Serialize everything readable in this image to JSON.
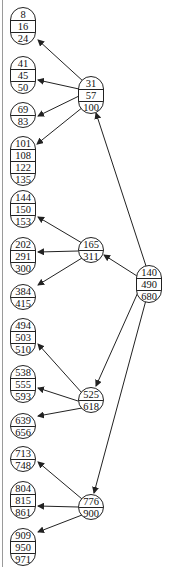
{
  "diagram": {
    "type": "b-tree",
    "root": {
      "id": "root",
      "keys": [
        "140",
        "490",
        "680"
      ],
      "x": 136,
      "y": 265,
      "w": 26
    },
    "internal": [
      {
        "id": "n1",
        "keys": [
          "31",
          "57",
          "100"
        ],
        "x": 78,
        "y": 76,
        "w": 26
      },
      {
        "id": "n2",
        "keys": [
          "165",
          "311"
        ],
        "x": 78,
        "y": 237,
        "w": 26
      },
      {
        "id": "n3",
        "keys": [
          "525",
          "618"
        ],
        "x": 78,
        "y": 387,
        "w": 26
      },
      {
        "id": "n4",
        "keys": [
          "776",
          "900"
        ],
        "x": 78,
        "y": 494,
        "w": 26
      }
    ],
    "leaves": [
      {
        "id": "l1",
        "keys": [
          "8",
          "16",
          "24"
        ],
        "x": 10,
        "y": 7,
        "w": 26
      },
      {
        "id": "l2",
        "keys": [
          "41",
          "45",
          "50"
        ],
        "x": 10,
        "y": 56,
        "w": 26
      },
      {
        "id": "l3",
        "keys": [
          "69",
          "83"
        ],
        "x": 10,
        "y": 102,
        "w": 26
      },
      {
        "id": "l4",
        "keys": [
          "101",
          "108",
          "122",
          "135"
        ],
        "x": 10,
        "y": 136,
        "w": 26
      },
      {
        "id": "l5",
        "keys": [
          "144",
          "150",
          "153"
        ],
        "x": 10,
        "y": 190,
        "w": 26
      },
      {
        "id": "l6",
        "keys": [
          "202",
          "291",
          "300"
        ],
        "x": 10,
        "y": 237,
        "w": 26
      },
      {
        "id": "l7",
        "keys": [
          "384",
          "415"
        ],
        "x": 10,
        "y": 284,
        "w": 26
      },
      {
        "id": "l8",
        "keys": [
          "494",
          "503",
          "510"
        ],
        "x": 10,
        "y": 318,
        "w": 26
      },
      {
        "id": "l9",
        "keys": [
          "538",
          "555",
          "593"
        ],
        "x": 10,
        "y": 365,
        "w": 26
      },
      {
        "id": "l10",
        "keys": [
          "639",
          "656"
        ],
        "x": 10,
        "y": 413,
        "w": 26
      },
      {
        "id": "l11",
        "keys": [
          "713",
          "748"
        ],
        "x": 10,
        "y": 446,
        "w": 26
      },
      {
        "id": "l12",
        "keys": [
          "804",
          "815",
          "861"
        ],
        "x": 10,
        "y": 481,
        "w": 26
      },
      {
        "id": "l13",
        "keys": [
          "909",
          "950",
          "971"
        ],
        "x": 10,
        "y": 528,
        "w": 26
      }
    ],
    "edges": [
      {
        "from": "root",
        "to": "n1",
        "x1": 146,
        "y1": 266,
        "x2": 96,
        "y2": 113
      },
      {
        "from": "root",
        "to": "n2",
        "x1": 137,
        "y1": 276,
        "x2": 104,
        "y2": 255
      },
      {
        "from": "root",
        "to": "n3",
        "x1": 139,
        "y1": 290,
        "x2": 96,
        "y2": 386
      },
      {
        "from": "root",
        "to": "n4",
        "x1": 146,
        "y1": 300,
        "x2": 94,
        "y2": 493
      },
      {
        "from": "n1",
        "to": "l1",
        "x1": 84,
        "y1": 82,
        "x2": 38,
        "y2": 40
      },
      {
        "from": "n1",
        "to": "l2",
        "x1": 79,
        "y1": 89,
        "x2": 38,
        "y2": 80
      },
      {
        "from": "n1",
        "to": "l3",
        "x1": 79,
        "y1": 96,
        "x2": 38,
        "y2": 116
      },
      {
        "from": "n1",
        "to": "l4",
        "x1": 83,
        "y1": 107,
        "x2": 37,
        "y2": 144
      },
      {
        "from": "n2",
        "to": "l5",
        "x1": 82,
        "y1": 243,
        "x2": 38,
        "y2": 217
      },
      {
        "from": "n2",
        "to": "l6",
        "x1": 78,
        "y1": 251,
        "x2": 38,
        "y2": 252
      },
      {
        "from": "n2",
        "to": "l7",
        "x1": 82,
        "y1": 258,
        "x2": 38,
        "y2": 285
      },
      {
        "from": "n3",
        "to": "l8",
        "x1": 82,
        "y1": 393,
        "x2": 38,
        "y2": 344
      },
      {
        "from": "n3",
        "to": "l9",
        "x1": 78,
        "y1": 401,
        "x2": 38,
        "y2": 388
      },
      {
        "from": "n3",
        "to": "l10",
        "x1": 82,
        "y1": 408,
        "x2": 38,
        "y2": 416
      },
      {
        "from": "n4",
        "to": "l11",
        "x1": 82,
        "y1": 499,
        "x2": 38,
        "y2": 462
      },
      {
        "from": "n4",
        "to": "l12",
        "x1": 78,
        "y1": 507,
        "x2": 38,
        "y2": 506
      },
      {
        "from": "n4",
        "to": "l13",
        "x1": 82,
        "y1": 515,
        "x2": 38,
        "y2": 532
      }
    ],
    "colors": {
      "stroke": "#222222",
      "background": "#ffffff",
      "border": "#9a9a9a"
    }
  }
}
